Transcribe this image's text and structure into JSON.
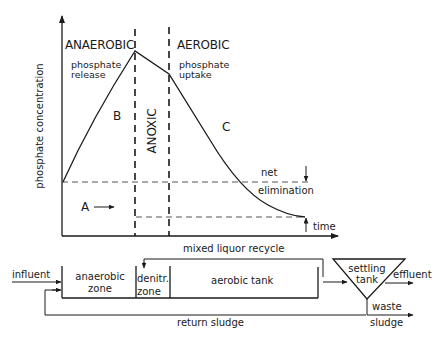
{
  "chart": {
    "y_axis_label": "phosphate concentration",
    "x_axis_label": "time",
    "phases": {
      "anaerobic": "ANAEROBIC",
      "anoxic": "ANOXIC",
      "aerobic": "AEROBIC"
    },
    "annotations": {
      "release": "phosphate release",
      "release_line1": "phosphate",
      "release_line2": "release",
      "uptake_line1": "phosphate",
      "uptake_line2": "uptake",
      "net": "net",
      "elimination": "elimination",
      "point_a": "A",
      "point_b": "B",
      "point_c": "C"
    }
  },
  "schematic": {
    "influent": "influent",
    "anaerobic_zone_line1": "anaerobic",
    "anaerobic_zone_line2": "zone",
    "denitr_zone_line1": "denitr.",
    "denitr_zone_line2": "zone",
    "aerobic_tank": "aerobic tank",
    "settling_tank_line1": "settling",
    "settling_tank_line2": "tank",
    "effluent": "effluent",
    "waste_line1": "waste",
    "waste_line2": "sludge",
    "mixed_liquor_recycle": "mixed liquor recycle",
    "return_sludge": "return sludge"
  },
  "colors": {
    "line": "#1a1a1a",
    "dashed": "#555555",
    "background": "#ffffff"
  }
}
